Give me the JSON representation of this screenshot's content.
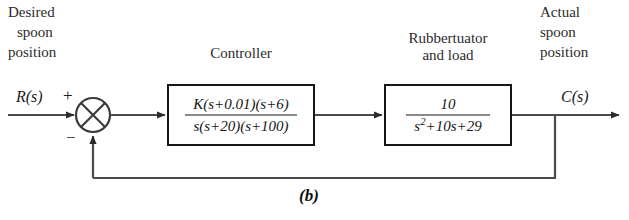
{
  "diagram": {
    "caption": "(b)",
    "input_label_lines": [
      "Desired",
      "spoon",
      "position"
    ],
    "output_label_lines": [
      "Actual",
      "spoon",
      "position"
    ],
    "input_signal": "R(s)",
    "output_signal": "C(s)",
    "summing_junction": {
      "name": "summing-junction",
      "plus_sign": "+",
      "minus_sign": "−"
    },
    "blocks": [
      {
        "title_lines": [
          "Controller"
        ],
        "numerator": "K(s+0.01)(s+6)",
        "denominator": "s(s+20)(s+100)"
      },
      {
        "title_lines": [
          "Rubbertuator",
          "and load"
        ],
        "numerator": "10",
        "denominator_prefix": "s",
        "denominator_exp": "2",
        "denominator_rest": "+10s+29"
      }
    ],
    "colors": {
      "line": "#4a4a4a",
      "block_border": "#171717",
      "text": "#1a1a1a",
      "background": "#ffffff"
    }
  }
}
